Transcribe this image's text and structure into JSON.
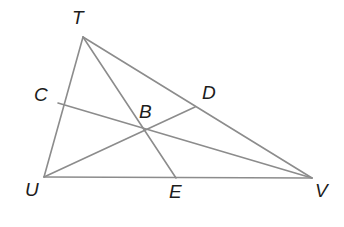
{
  "figure": {
    "type": "geometry-diagram",
    "background_color": "#ffffff",
    "stroke_color": "#8c8c8c",
    "label_color": "#1c1c1c",
    "width": 344,
    "height": 227
  },
  "points": {
    "T": {
      "label": "T",
      "x": 83,
      "y": 37,
      "label_x": 72,
      "label_y": 8
    },
    "U": {
      "label": "U",
      "x": 44,
      "y": 177,
      "label_x": 25,
      "label_y": 180
    },
    "V": {
      "label": "V",
      "x": 312,
      "y": 178,
      "label_x": 315,
      "label_y": 181
    },
    "C": {
      "label": "C",
      "x": 58,
      "y": 103,
      "label_x": 34,
      "label_y": 85
    },
    "D": {
      "label": "D",
      "x": 195,
      "y": 107,
      "label_x": 202,
      "label_y": 83
    },
    "E": {
      "label": "E",
      "x": 176,
      "y": 178,
      "label_x": 169,
      "label_y": 182
    },
    "B": {
      "label": "B",
      "x": 148,
      "y": 132,
      "label_x": 139,
      "label_y": 102
    }
  },
  "segments": [
    {
      "name": "side-TU",
      "from": "T",
      "to": "U"
    },
    {
      "name": "side-UV",
      "from": "U",
      "to": "V"
    },
    {
      "name": "side-TV",
      "from": "T",
      "to": "V"
    },
    {
      "name": "median-TE",
      "from": "T",
      "to": "E"
    },
    {
      "name": "median-UD",
      "from": "U",
      "to": "D"
    },
    {
      "name": "median-VC",
      "from": "V",
      "to": "C"
    }
  ]
}
